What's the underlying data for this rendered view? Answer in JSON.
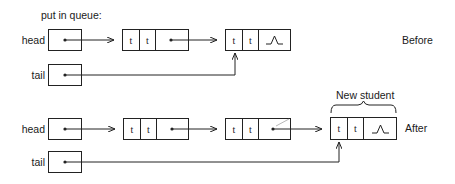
{
  "title": "put in queue:",
  "before": {
    "label": "Before",
    "head_label": "head",
    "tail_label": "tail",
    "nodes": [
      {
        "fields": [
          "t",
          "t"
        ],
        "next": "pointer"
      },
      {
        "fields": [
          "t",
          "t"
        ],
        "next": "nil"
      }
    ]
  },
  "after": {
    "label": "After",
    "head_label": "head",
    "tail_label": "tail",
    "new_node_label": "New student",
    "nodes": [
      {
        "fields": [
          "t",
          "t"
        ],
        "next": "pointer"
      },
      {
        "fields": [
          "t",
          "t"
        ],
        "next": "pointer"
      },
      {
        "fields": [
          "t",
          "t"
        ],
        "next": "nil"
      }
    ]
  },
  "symbols": {
    "nil": "nil-caret"
  },
  "colors": {
    "line": "#222222",
    "text": "#1a1a1a",
    "background": "#ffffff"
  }
}
